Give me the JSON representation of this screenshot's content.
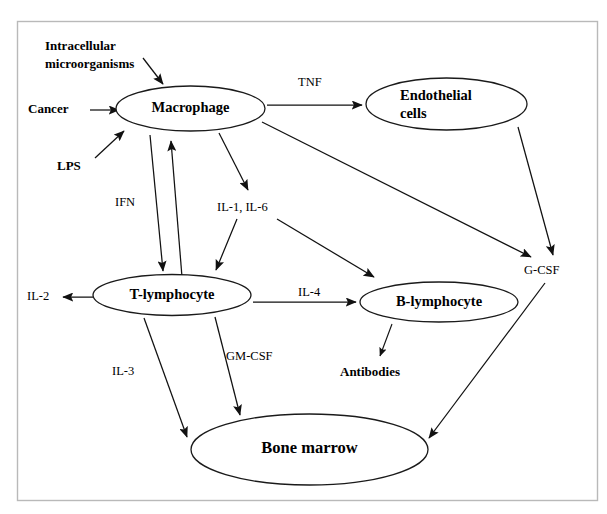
{
  "figure": {
    "type": "flow-diagram",
    "title": "",
    "background_color": "#ffffff",
    "border_color": "#b9b9b9",
    "line_color": "#111111"
  },
  "nodes": {
    "macrophage": "Macrophage",
    "endothelial_line1": "Endothelial",
    "endothelial_line2": "cells",
    "t_lymphocyte": "T-lymphocyte",
    "b_lymphocyte": "B-lymphocyte",
    "bone_marrow": "Bone marrow"
  },
  "stimuli": {
    "intracellular_line1": "Intracellular",
    "intracellular_line2": "microorganisms",
    "cancer": "Cancer",
    "lps": "LPS"
  },
  "products": {
    "antibodies": "Antibodies",
    "il2": "IL-2",
    "gcsf": "G-CSF",
    "il1_il6": "IL-1, IL-6"
  },
  "edge_labels": {
    "tnf": "TNF",
    "ifn": "IFN",
    "il4": "IL-4",
    "il3": "IL-3",
    "gmcsf": "GM-CSF"
  },
  "edges": [
    {
      "from": "Intracellular microorganisms",
      "to": "Macrophage",
      "label": ""
    },
    {
      "from": "Cancer",
      "to": "Macrophage",
      "label": ""
    },
    {
      "from": "LPS",
      "to": "Macrophage",
      "label": ""
    },
    {
      "from": "Macrophage",
      "to": "Endothelial cells",
      "label": "TNF"
    },
    {
      "from": "Macrophage",
      "to": "G-CSF",
      "label": ""
    },
    {
      "from": "Endothelial cells",
      "to": "G-CSF",
      "label": ""
    },
    {
      "from": "Macrophage",
      "to": "T-lymphocyte",
      "label": ""
    },
    {
      "from": "T-lymphocyte",
      "to": "Macrophage",
      "label": "IFN"
    },
    {
      "from": "Macrophage",
      "to": "IL-1, IL-6",
      "label": ""
    },
    {
      "from": "IL-1, IL-6",
      "to": "T-lymphocyte",
      "label": ""
    },
    {
      "from": "IL-1, IL-6",
      "to": "B-lymphocyte",
      "label": ""
    },
    {
      "from": "T-lymphocyte",
      "to": "IL-2",
      "label": ""
    },
    {
      "from": "T-lymphocyte",
      "to": "B-lymphocyte",
      "label": "IL-4"
    },
    {
      "from": "T-lymphocyte",
      "to": "Bone marrow",
      "label": "IL-3"
    },
    {
      "from": "T-lymphocyte",
      "to": "Bone marrow",
      "label": "GM-CSF"
    },
    {
      "from": "B-lymphocyte",
      "to": "Antibodies",
      "label": ""
    },
    {
      "from": "G-CSF",
      "to": "Bone marrow",
      "label": ""
    }
  ]
}
